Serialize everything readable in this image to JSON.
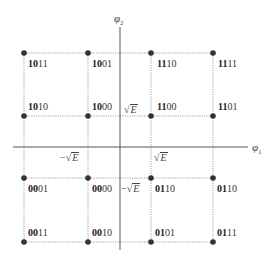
{
  "diagram": {
    "type": "16-QAM signal constellation",
    "axes": {
      "horizontal_label": "φ",
      "horizontal_sub": "1",
      "vertical_label": "φ",
      "vertical_sub": "2"
    },
    "tick_labels": {
      "pos_x": "E",
      "neg_x": "E",
      "pos_y": "E",
      "neg_y": "E",
      "neg_prefix": "−"
    },
    "colors": {
      "axis": "#555555",
      "grid": "#888888",
      "dot": "#333333"
    },
    "points": [
      {
        "row": 0,
        "col": 0,
        "bold": "10",
        "rest": "11"
      },
      {
        "row": 0,
        "col": 1,
        "bold": "10",
        "rest": "01"
      },
      {
        "row": 0,
        "col": 2,
        "bold": "11",
        "rest": "10"
      },
      {
        "row": 0,
        "col": 3,
        "bold": "11",
        "rest": "11"
      },
      {
        "row": 1,
        "col": 0,
        "bold": "10",
        "rest": "10"
      },
      {
        "row": 1,
        "col": 1,
        "bold": "10",
        "rest": "00"
      },
      {
        "row": 1,
        "col": 2,
        "bold": "11",
        "rest": "00"
      },
      {
        "row": 1,
        "col": 3,
        "bold": "11",
        "rest": "01"
      },
      {
        "row": 2,
        "col": 0,
        "bold": "00",
        "rest": "01"
      },
      {
        "row": 2,
        "col": 1,
        "bold": "00",
        "rest": "00"
      },
      {
        "row": 2,
        "col": 2,
        "bold": "01",
        "rest": "10"
      },
      {
        "row": 2,
        "col": 3,
        "bold": "01",
        "rest": "10"
      },
      {
        "row": 3,
        "col": 0,
        "bold": "00",
        "rest": "11"
      },
      {
        "row": 3,
        "col": 1,
        "bold": "00",
        "rest": "10"
      },
      {
        "row": 3,
        "col": 2,
        "bold": "01",
        "rest": "01"
      },
      {
        "row": 3,
        "col": 3,
        "bold": "01",
        "rest": "11"
      }
    ]
  }
}
